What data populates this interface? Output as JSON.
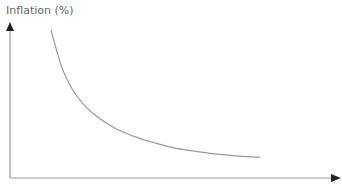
{
  "chart_data": {
    "type": "line",
    "title": "",
    "xlabel": "",
    "ylabel": "Inflation (%)",
    "grid": false,
    "legend": null,
    "series": [
      {
        "name": "curve",
        "shape": "hyperbola-like decreasing curve (Phillips curve style)",
        "x": [
          0.0,
          0.05,
          0.1,
          0.15,
          0.2,
          0.3,
          0.4,
          0.5,
          0.6,
          0.7,
          0.8,
          0.9,
          1.0
        ],
        "y": [
          1.0,
          0.72,
          0.55,
          0.44,
          0.36,
          0.25,
          0.18,
          0.13,
          0.09,
          0.065,
          0.045,
          0.03,
          0.02
        ]
      }
    ],
    "xlim": [
      0,
      1
    ],
    "ylim": [
      0,
      1
    ],
    "axis_color": "#999999",
    "line_color": "#999999"
  }
}
